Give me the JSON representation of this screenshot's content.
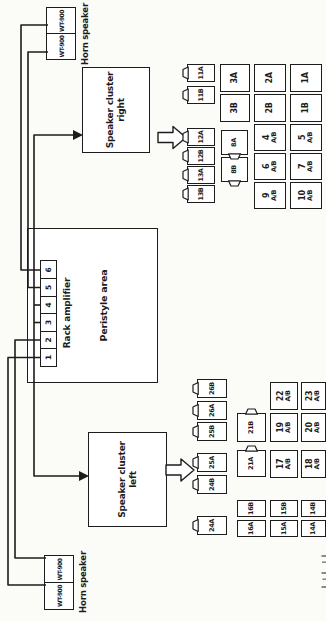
{
  "ink_color": "#1c1c1c",
  "paper_color": "#fbfbf8",
  "horn_left": {
    "box1": "WT-900",
    "box2": "WT-900",
    "label": "Horn speaker"
  },
  "horn_right": {
    "box1": "WT-900",
    "box2": "WT-900",
    "label": "Horn speaker"
  },
  "cluster_left": {
    "line1": "Speaker cluster",
    "line2": "left"
  },
  "cluster_right": {
    "line1": "Speaker cluster",
    "line2": "right"
  },
  "peristyle": {
    "area_label": "Peristyle area",
    "amplifier_label": "Rack amplifier",
    "terminals": [
      "1",
      "2",
      "3",
      "4",
      "5",
      "6"
    ]
  },
  "grid_right": {
    "connectors": [
      "13B",
      "13A",
      "12B",
      "12A",
      "11B",
      "11A"
    ],
    "plugs": [
      "8B",
      "8A"
    ],
    "row2": [
      "3B",
      "3A"
    ],
    "row3": [
      {
        "l1": "9",
        "l2": "A/B"
      },
      {
        "l1": "6",
        "l2": "A/B"
      },
      {
        "l1": "4",
        "l2": "A/B"
      },
      {
        "l1": "2B",
        "l2": ""
      },
      {
        "l1": "2A",
        "l2": ""
      }
    ],
    "row4": [
      {
        "l1": "10",
        "l2": "A/B"
      },
      {
        "l1": "7",
        "l2": "A/B"
      },
      {
        "l1": "5",
        "l2": "A/B"
      },
      {
        "l1": "1B",
        "l2": ""
      },
      {
        "l1": "1A",
        "l2": ""
      }
    ]
  },
  "grid_left": {
    "connectors": [
      "24A",
      "24B",
      "25A",
      "25B",
      "26A",
      "26B"
    ],
    "row2_small": [
      "16A",
      "16B"
    ],
    "plugs": [
      "21A",
      "21B"
    ],
    "row3": [
      {
        "l1": "15A",
        "l2": ""
      },
      {
        "l1": "15B",
        "l2": ""
      },
      {
        "l1": "17",
        "l2": "A/B"
      },
      {
        "l1": "19",
        "l2": "A/B"
      },
      {
        "l1": "22",
        "l2": "A/B"
      }
    ],
    "row4": [
      {
        "l1": "14A",
        "l2": ""
      },
      {
        "l1": "14B",
        "l2": ""
      },
      {
        "l1": "18",
        "l2": "A/B"
      },
      {
        "l1": "20",
        "l2": "A/B"
      },
      {
        "l1": "23",
        "l2": "A/B"
      }
    ]
  }
}
